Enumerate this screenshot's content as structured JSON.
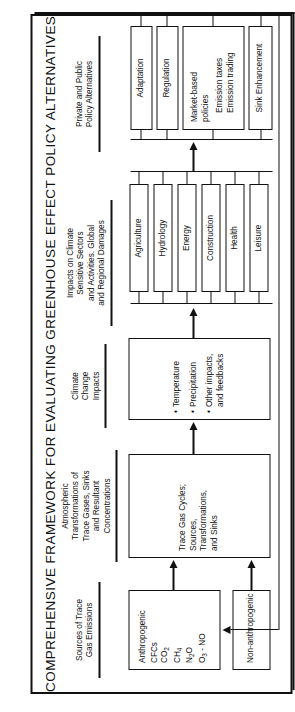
{
  "figure": {
    "title": "COMPREHENSIVE FRAMEWORK FOR EVALUATING GREENHOUSE EFFECT POLICY ALTERNATIVES",
    "orientation": "rotated-90-ccw",
    "accent_color": "#111111",
    "background_color": "#ffffff"
  },
  "columns": [
    {
      "id": "sources",
      "heading": [
        "Sources of Trace",
        "Gas Emissions"
      ]
    },
    {
      "id": "atmospheric",
      "heading": [
        "Atmospheric",
        "Transformations of",
        "Trace Gases, Sinks",
        "and Resultant",
        "Concentrations"
      ]
    },
    {
      "id": "climate",
      "heading": [
        "Climate",
        "Change",
        "Impacts"
      ]
    },
    {
      "id": "impacts",
      "heading": [
        "Impacts on Climate",
        "Sensitive Sectors",
        "and Activities. Global",
        "and Regional Damages"
      ]
    },
    {
      "id": "policy",
      "heading": [
        "Private and Public",
        "Policy Alternatives"
      ]
    }
  ],
  "boxes": {
    "anthropogenic": {
      "title": "Anthropogenic",
      "items": [
        "CFCs",
        "CO2",
        "CH4",
        "N2O",
        "O3 - NO"
      ]
    },
    "non_anthropogenic": {
      "title": "Non-anthropogenic"
    },
    "trace_gas_cycles": {
      "lines": [
        "Trace Gas Cycles;",
        "Sources,",
        "Transformations,",
        "and Sinks"
      ]
    },
    "climate_change_impacts": {
      "items": [
        "Temperature",
        "Precipitation",
        "Other impacts,"
      ],
      "item3_line2": "and feedbacks"
    }
  },
  "sectors": [
    "Agriculture",
    "Hydrology",
    "Energy",
    "Construction",
    "Health",
    "Leisure"
  ],
  "policies": [
    {
      "label": "Adaptation"
    },
    {
      "label": "Regulation"
    },
    {
      "label": "Market-based",
      "label2": "policies",
      "sub1": "Emission taxes",
      "sub2": "Emission trading"
    },
    {
      "label": "Sink Enhancement"
    }
  ]
}
